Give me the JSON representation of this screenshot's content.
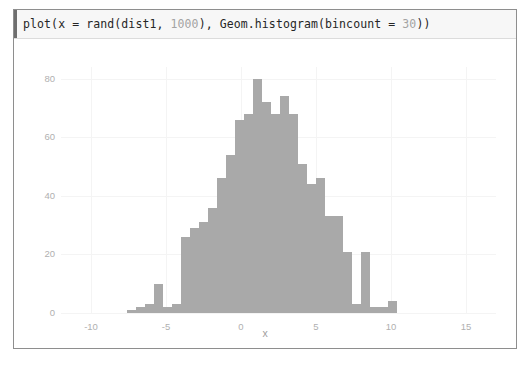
{
  "cell": {
    "code_prefix": "plot",
    "code_line": "plot(x = rand(dist1, 1000), Geom.histogram(bincount = 30))",
    "code_segments": [
      {
        "text": "plot(",
        "dim": false
      },
      {
        "text": "x = rand(dist1, ",
        "dim": false
      },
      {
        "text": "1000",
        "dim": true
      },
      {
        "text": "), Geom.histogram(bincount = ",
        "dim": false
      },
      {
        "text": "30",
        "dim": true
      },
      {
        "text": "))",
        "dim": false
      }
    ]
  },
  "colors": {
    "bar_fill": "#a9a9a9",
    "grid": "#f4f4f4",
    "tick_text": "#b0b0b0",
    "axis_title": "#9e9e9e",
    "code_background": "#f7f7f7",
    "code_text": "#262626",
    "code_dim_text": "#a3a3a3",
    "frame_border": "#8e8e8e"
  },
  "chart_data": {
    "type": "bar",
    "title": "",
    "subtitle": "",
    "xlabel": "x",
    "ylabel": "",
    "xlim": [
      -12.0,
      17.0
    ],
    "ylim": [
      0,
      84
    ],
    "grid": true,
    "legend": null,
    "legend_position": "none",
    "xticks": [
      -10,
      -5,
      0,
      5,
      10,
      15
    ],
    "yticks": [
      0,
      20,
      40,
      60,
      80
    ],
    "bincount": 30,
    "sample_size": 1000,
    "bin_width": 0.6,
    "bin_left_edges": [
      -7.6,
      -7.0,
      -6.4,
      -5.8,
      -5.2,
      -4.6,
      -4.0,
      -3.4,
      -2.8,
      -2.2,
      -1.6,
      -1.0,
      -0.4,
      0.2,
      0.8,
      1.4,
      2.0,
      2.6,
      3.2,
      3.8,
      4.4,
      5.0,
      5.6,
      6.2,
      6.8,
      7.4,
      8.0,
      8.6,
      9.2,
      9.8
    ],
    "bin_centers": [
      -7.3,
      -6.7,
      -6.1,
      -5.5,
      -4.9,
      -4.3,
      -3.7,
      -3.1,
      -2.5,
      -1.9,
      -1.3,
      -0.7,
      -0.1,
      0.5,
      1.1,
      1.7,
      2.3,
      2.9,
      3.5,
      4.1,
      4.7,
      5.3,
      5.9,
      6.5,
      7.1,
      7.7,
      8.3,
      8.9,
      9.5,
      10.1
    ],
    "values": [
      1,
      2,
      3,
      10,
      2,
      3,
      26,
      29,
      31,
      36,
      46,
      54,
      66,
      68,
      80,
      72,
      68,
      74,
      68,
      51,
      44,
      46,
      33,
      33,
      21,
      3,
      21,
      2,
      2,
      4
    ],
    "categories": [
      "-7.3",
      "-6.7",
      "-6.1",
      "-5.5",
      "-4.9",
      "-4.3",
      "-3.7",
      "-3.1",
      "-2.5",
      "-1.9",
      "-1.3",
      "-0.7",
      "-0.1",
      "0.5",
      "1.1",
      "1.7",
      "2.3",
      "2.9",
      "3.5",
      "4.1",
      "4.7",
      "5.3",
      "5.9",
      "6.5",
      "7.1",
      "7.7",
      "8.3",
      "8.9",
      "9.5",
      "10.1"
    ]
  }
}
